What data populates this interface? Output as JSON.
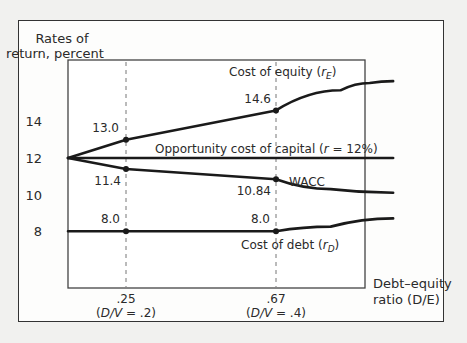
{
  "chart_data": {
    "type": "line",
    "title": "",
    "ylabel": "Rates of return, percent",
    "ylabel_lines": [
      "Rates of",
      "return, percent"
    ],
    "xlabel": "Debt–equity ratio (D/E)",
    "xlabel_lines": [
      "Debt–equity",
      "ratio (D/E)"
    ],
    "yticks": [
      8,
      10,
      12,
      14
    ],
    "ylim": [
      6.2,
      16.9
    ],
    "xlim": [
      0,
      1.45
    ],
    "grid": false,
    "reference_lines": [
      {
        "x": 0.25,
        "label": ".25",
        "sublabel": "(D/V = .2)"
      },
      {
        "x": 0.67,
        "label": ".67",
        "sublabel": "(D/V = .4)"
      }
    ],
    "series": [
      {
        "name": "Cost of equity (rE)",
        "label_main": "Cost of equity (",
        "label_var": "r",
        "label_sub": "E",
        "label_end": ")",
        "x": [
          0,
          0.25,
          0.67,
          1.0,
          1.15,
          1.27
        ],
        "values": [
          12.0,
          13.0,
          14.6,
          15.7,
          16.1,
          16.2
        ]
      },
      {
        "name": "Opportunity cost of capital (r = 12%)",
        "label_main": "Opportunity cost of capital (",
        "label_var": "r",
        "label_end": " = 12%)",
        "x": [
          0,
          1.27
        ],
        "values": [
          12.0,
          12.0
        ]
      },
      {
        "name": "WACC",
        "label_main": "WACC",
        "x": [
          0,
          0.25,
          0.67,
          0.95,
          1.27
        ],
        "values": [
          12.0,
          11.4,
          10.84,
          10.3,
          10.1
        ]
      },
      {
        "name": "Cost of debt (rD)",
        "label_main": "Cost of debt (",
        "label_var": "r",
        "label_sub": "D",
        "label_end": ")",
        "x": [
          0,
          0.25,
          0.67,
          0.95,
          1.27
        ],
        "values": [
          8.0,
          8.0,
          8.0,
          8.25,
          8.7
        ]
      }
    ],
    "annotations": [
      {
        "text": "13.0",
        "x": 0.25,
        "y": 13.0
      },
      {
        "text": "14.6",
        "x": 0.67,
        "y": 14.6
      },
      {
        "text": "11.4",
        "x": 0.25,
        "y": 11.4
      },
      {
        "text": "10.84",
        "x": 0.67,
        "y": 10.84
      },
      {
        "text": "8.0",
        "x": 0.25,
        "y": 8.0
      },
      {
        "text": "8.0",
        "x": 0.67,
        "y": 8.0
      }
    ],
    "legend_position": "inline"
  },
  "colors": {
    "line": "#1a1a1a",
    "axis": "#444444",
    "dash": "#777777"
  }
}
